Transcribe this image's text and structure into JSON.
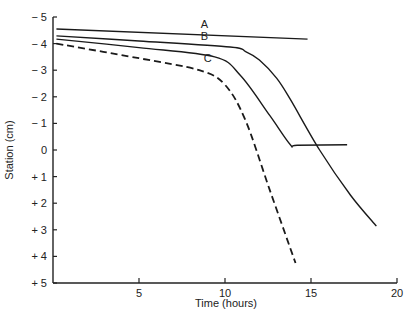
{
  "chart_data": {
    "type": "line",
    "title": "",
    "xlabel": "Time (hours)",
    "ylabel": "Station (cm)",
    "xlim": [
      0,
      20
    ],
    "ylim": [
      -5,
      5
    ],
    "y_inverted": true,
    "grid": false,
    "x_ticks": [
      5,
      10,
      15,
      20
    ],
    "x_tick_labels": [
      "5",
      "10",
      "15",
      "20"
    ],
    "y_ticks": [
      -5,
      -4,
      -3,
      -2,
      -1,
      0,
      1,
      2,
      3,
      4,
      5
    ],
    "y_tick_labels": [
      "− 5",
      "− 4",
      "− 3",
      "− 2",
      "− 1",
      "0",
      "+ 1",
      "+ 2",
      "+ 3",
      "+ 4",
      "+ 5"
    ],
    "series": [
      {
        "name": "A",
        "style": "solid",
        "x": [
          0.2,
          14.8
        ],
        "y": [
          -4.55,
          -4.17
        ],
        "label_pos": [
          8.8,
          -4.72
        ]
      },
      {
        "name": "B",
        "style": "solid",
        "x": [
          0.2,
          5.0,
          10.3,
          11.2,
          12.0,
          13.0,
          13.8,
          15.5,
          17.3,
          18.8
        ],
        "y": [
          -4.29,
          -4.1,
          -3.87,
          -3.7,
          -3.38,
          -2.7,
          -1.9,
          0.0,
          1.7,
          2.86
        ],
        "label_pos": [
          8.8,
          -4.28
        ]
      },
      {
        "name": "C",
        "style": "solid",
        "x": [
          0.2,
          5.0,
          9.4,
          10.9,
          12.6,
          13.8,
          14.2,
          17.1
        ],
        "y": [
          -4.17,
          -3.85,
          -3.5,
          -2.8,
          -1.3,
          -0.2,
          -0.18,
          -0.2
        ],
        "label_pos": [
          9.0,
          -3.45
        ]
      },
      {
        "name": "C (dashed)",
        "style": "dashed",
        "x": [
          0.2,
          5.0,
          8.5,
          10.0,
          11.2,
          12.6,
          14.1
        ],
        "y": [
          -4.0,
          -3.45,
          -3.0,
          -2.45,
          -1.1,
          1.5,
          4.25
        ]
      }
    ]
  }
}
